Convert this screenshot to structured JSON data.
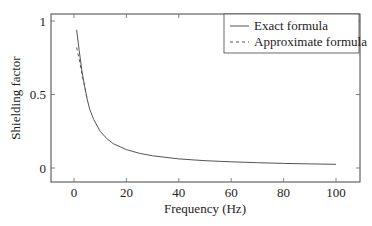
{
  "chart_data": {
    "type": "line",
    "title": "",
    "xlabel": "Frequency (Hz)",
    "ylabel": "Shielding factor",
    "xlim": [
      -8,
      108
    ],
    "ylim": [
      -0.08,
      1.04
    ],
    "xticks": [
      0,
      20,
      40,
      60,
      80,
      100
    ],
    "xtick_labels": [
      "0",
      "20",
      "40",
      "60",
      "80",
      "100"
    ],
    "yticks": [
      0,
      0.5,
      1
    ],
    "ytick_labels": [
      "0",
      "0.5",
      "1"
    ],
    "grid": false,
    "legend_position": "upper right",
    "series": [
      {
        "name": "Exact formula",
        "style": "solid",
        "color": "#555555",
        "x": [
          1,
          2,
          3,
          4,
          5,
          6,
          7.5,
          10,
          12.5,
          15,
          20,
          25,
          30,
          40,
          50,
          60,
          70,
          80,
          90,
          100
        ],
        "y": [
          0.94,
          0.8,
          0.66,
          0.56,
          0.47,
          0.4,
          0.33,
          0.25,
          0.2,
          0.165,
          0.125,
          0.1,
          0.083,
          0.062,
          0.05,
          0.042,
          0.036,
          0.031,
          0.028,
          0.025
        ]
      },
      {
        "name": "Approximate formula",
        "style": "dashed",
        "color": "#555555",
        "x": [
          1,
          2,
          3,
          4,
          5
        ],
        "y": [
          0.82,
          0.74,
          0.64,
          0.56,
          0.47
        ]
      }
    ]
  },
  "legend": {
    "items": [
      {
        "label": "Exact formula",
        "style": "solid"
      },
      {
        "label": "Approximate formula",
        "style": "dashed"
      }
    ]
  },
  "axes": {
    "xlabel": "Frequency (Hz)",
    "ylabel": "Shielding factor"
  }
}
